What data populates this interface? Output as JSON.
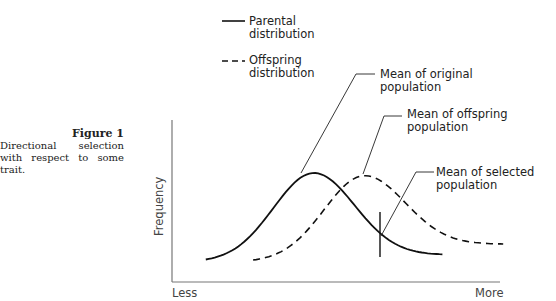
{
  "caption": {
    "title": "Figure 1",
    "description": "Directional selection with respect to some trait."
  },
  "legend": {
    "parental": [
      "Parental",
      "distribution"
    ],
    "offspring": [
      "Offspring",
      "distribution"
    ]
  },
  "axes": {
    "ylabel": "Frequency",
    "x_left": "Less",
    "x_right": "More"
  },
  "annotations": {
    "original_mean": [
      "Mean of original",
      "population"
    ],
    "offspring_mean": [
      "Mean of offspring",
      "population"
    ],
    "selected_mean": [
      "Mean of selected",
      "population"
    ]
  },
  "curves": {
    "parental": {
      "style": "solid",
      "mean": 0.42,
      "sd": 0.12,
      "baseline": 0.08,
      "peak": 1.0,
      "x_range": [
        0.1,
        0.8
      ]
    },
    "offspring": {
      "style": "dashed",
      "mean": 0.57,
      "sd": 0.12,
      "baseline": 0.2,
      "peak": 0.97,
      "x_range": [
        0.24,
        0.98
      ]
    },
    "selection_threshold": 0.65
  }
}
